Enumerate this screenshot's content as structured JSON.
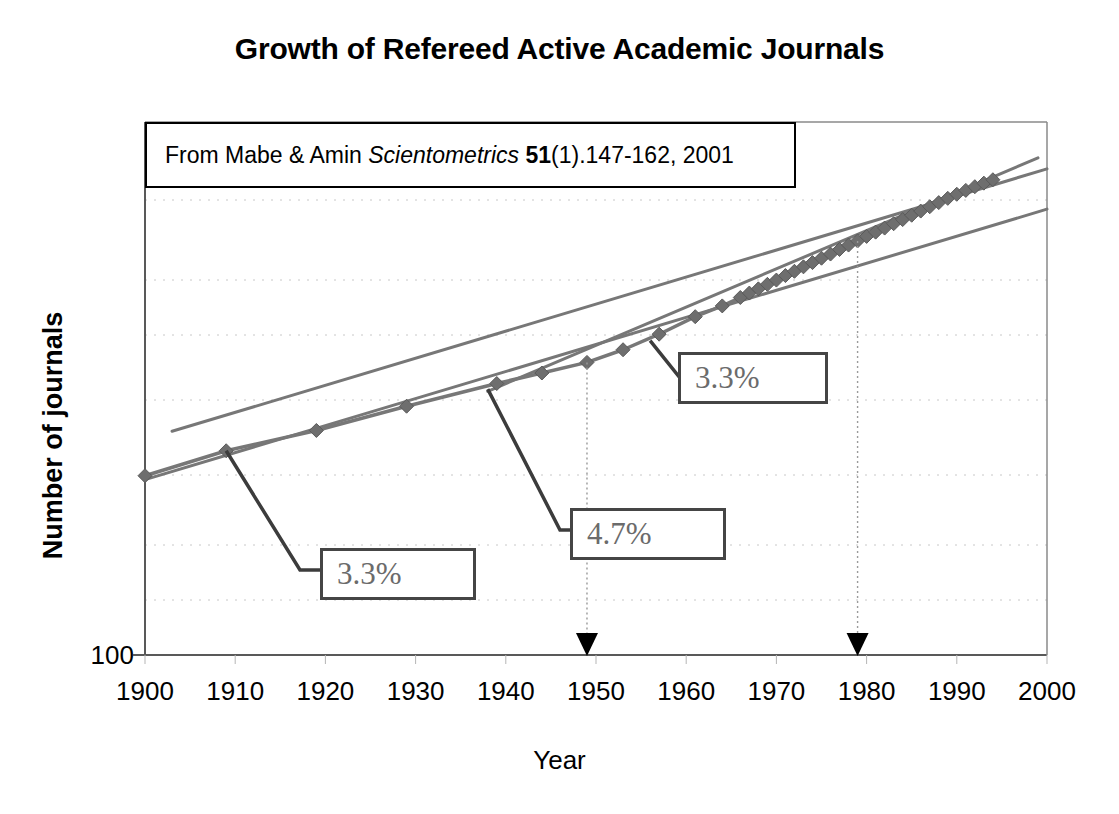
{
  "chart_data": {
    "type": "line",
    "title": "Growth of Refereed Active Academic Journals",
    "xlabel": "Year",
    "ylabel": "Number of journals",
    "yscale": "log",
    "ylim": [
      100,
      60000
    ],
    "xlim": [
      1900,
      2000
    ],
    "grid": "horizontal dotted minor log gridlines",
    "legend": "none",
    "y_tick_labels": [
      "100"
    ],
    "x_tick_labels": [
      "1900",
      "1910",
      "1920",
      "1930",
      "1940",
      "1950",
      "1960",
      "1970",
      "1980",
      "1990",
      "2000"
    ],
    "source_note": {
      "prefix": "From Mabe & Amin ",
      "journal": "Scientometrics",
      "volume": "51",
      "suffix": "(1).147-162, 2001",
      "full_text": "From Mabe & Amin Scientometrics 51(1).147-162, 2001"
    },
    "series": [
      {
        "name": "Refereed active academic journals",
        "marker": "diamond",
        "color": "#777777",
        "x": [
          1900,
          1909,
          1919,
          1929,
          1939,
          1944,
          1949,
          1953,
          1957,
          1961,
          1964,
          1966,
          1967,
          1968,
          1969,
          1970,
          1971,
          1972,
          1973,
          1974,
          1975,
          1976,
          1977,
          1978,
          1979,
          1980,
          1981,
          1982,
          1983,
          1984,
          1985,
          1986,
          1987,
          1988,
          1989,
          1990,
          1991,
          1992,
          1993,
          1994
        ],
        "values": [
          860,
          1160,
          1480,
          1980,
          2600,
          2950,
          3350,
          3900,
          4700,
          5800,
          6600,
          7300,
          7700,
          8100,
          8550,
          9000,
          9500,
          10000,
          10550,
          11100,
          11700,
          12300,
          13000,
          13700,
          14400,
          15200,
          16000,
          16800,
          17700,
          18600,
          19600,
          20600,
          21700,
          22800,
          24000,
          25200,
          26400,
          27600,
          28800,
          30000
        ]
      }
    ],
    "trend_lines": [
      {
        "name": "early-growth-trend",
        "label": "3.3%",
        "rate_percent": 3.3,
        "x_start": 1900,
        "x_end": 2000,
        "color": "#777777"
      },
      {
        "name": "postwar-growth-trend",
        "label": "4.7%",
        "rate_percent": 4.7,
        "x_start": 1938,
        "x_end": 2000,
        "color": "#777777"
      },
      {
        "name": "modern-growth-trend",
        "label": "3.3%",
        "rate_percent": 3.3,
        "x_start": 1900,
        "x_end": 2000,
        "color": "#777777"
      }
    ],
    "annotations": [
      {
        "name": "callout-3-3-early",
        "label": "3.3%",
        "points_to_year": 1909
      },
      {
        "name": "callout-4-7",
        "label": "4.7%",
        "points_to_year": 1939
      },
      {
        "name": "callout-3-3-modern",
        "label": "3.3%",
        "points_to_year": 1957
      }
    ],
    "markers": [
      {
        "name": "arrow-marker-1",
        "year": 1949,
        "glyph": "down-arrow",
        "color": "#000000"
      },
      {
        "name": "arrow-marker-2",
        "year": 1979,
        "glyph": "down-arrow",
        "color": "#000000"
      }
    ],
    "colors": {
      "series": "#777777",
      "trend": "#777777",
      "axis": "#595959",
      "gridline": "#c8c8c8",
      "callout_text": "#6b6b6b",
      "callout_border": "#454545",
      "text": "#000000"
    }
  }
}
